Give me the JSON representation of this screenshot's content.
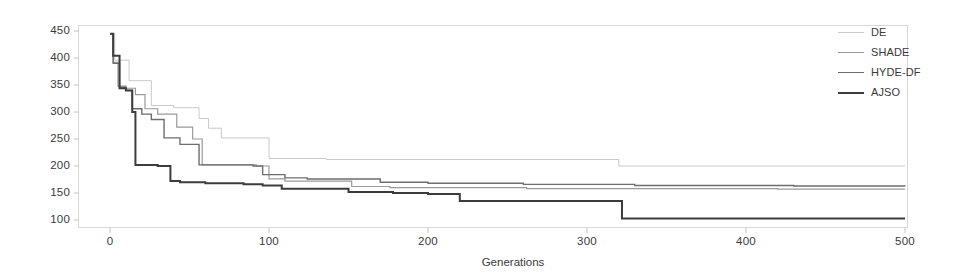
{
  "chart_data": {
    "type": "line",
    "title": "",
    "subtitle": "",
    "xlabel": "Generations",
    "ylabel": "",
    "xlim": [
      0,
      500
    ],
    "ylim": [
      100,
      450
    ],
    "grid": false,
    "legend_position": "top-right",
    "x_ticks": [
      0,
      100,
      200,
      300,
      400,
      500
    ],
    "y_ticks": [
      100,
      150,
      200,
      250,
      300,
      350,
      400,
      450
    ],
    "step_style": "post",
    "annotations": [],
    "series": [
      {
        "name": "DE",
        "color": "#c9c9c9",
        "width": 1.0,
        "final_value": 200,
        "x": [
          0,
          3,
          6,
          12,
          18,
          26,
          40,
          52,
          56,
          62,
          70,
          76,
          100,
          136,
          320,
          500
        ],
        "y": [
          445,
          396,
          396,
          358,
          358,
          312,
          308,
          308,
          288,
          270,
          252,
          252,
          214,
          212,
          200,
          200
        ]
      },
      {
        "name": "SHADE",
        "color": "#9a9a9a",
        "width": 1.2,
        "final_value": 157,
        "x": [
          0,
          2,
          5,
          10,
          16,
          22,
          30,
          42,
          52,
          58,
          70,
          92,
          100,
          110,
          136,
          152,
          176,
          200,
          262,
          320,
          420,
          500
        ],
        "y": [
          445,
          392,
          348,
          344,
          332,
          306,
          296,
          272,
          250,
          202,
          202,
          200,
          176,
          172,
          172,
          162,
          160,
          160,
          158,
          158,
          157,
          157
        ]
      },
      {
        "name": "HYDE-DF",
        "color": "#6e6e6e",
        "width": 1.4,
        "final_value": 162,
        "x": [
          0,
          2,
          6,
          10,
          14,
          20,
          26,
          34,
          44,
          56,
          72,
          90,
          96,
          110,
          124,
          150,
          170,
          200,
          260,
          330,
          430,
          500
        ],
        "y": [
          445,
          390,
          346,
          340,
          306,
          296,
          286,
          252,
          240,
          202,
          202,
          200,
          184,
          178,
          176,
          176,
          170,
          168,
          166,
          164,
          163,
          162
        ]
      },
      {
        "name": "AJSO",
        "color": "#3c3c3c",
        "width": 2.0,
        "final_value": 103,
        "x": [
          0,
          2,
          6,
          10,
          14,
          16,
          22,
          30,
          38,
          44,
          60,
          84,
          96,
          108,
          122,
          150,
          178,
          200,
          220,
          260,
          300,
          322,
          400,
          500
        ],
        "y": [
          445,
          404,
          344,
          340,
          300,
          202,
          202,
          200,
          172,
          170,
          168,
          166,
          164,
          158,
          158,
          152,
          150,
          148,
          135,
          135,
          135,
          103,
          103,
          103
        ]
      }
    ]
  },
  "legend": {
    "items": [
      {
        "label": "DE"
      },
      {
        "label": "SHADE"
      },
      {
        "label": "HYDE-DF"
      },
      {
        "label": "AJSO"
      }
    ]
  },
  "axes": {
    "x_tick_labels": [
      "0",
      "100",
      "200",
      "300",
      "400",
      "500"
    ],
    "y_tick_labels": [
      "450",
      "400",
      "350",
      "300",
      "250",
      "200",
      "150",
      "100"
    ],
    "x_axis_title": "Generations"
  }
}
